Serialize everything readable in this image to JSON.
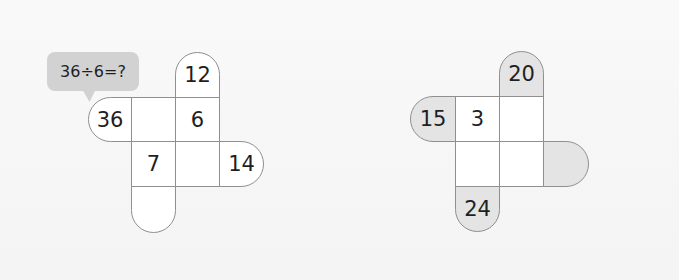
{
  "hint_bubble": {
    "text": "36÷6=?"
  },
  "colors": {
    "border": "#8f8f8f",
    "shaded": "#e4e4e4",
    "bubble": "#d2d2d2"
  },
  "puzzle_left": {
    "top_tab": "12",
    "left_tab": "36",
    "right_tab": "14",
    "bottom_tab": "",
    "grid": [
      [
        "",
        "6"
      ],
      [
        "7",
        ""
      ]
    ]
  },
  "puzzle_right": {
    "top_tab": "20",
    "left_tab": "15",
    "right_tab": "",
    "bottom_tab": "24",
    "grid": [
      [
        "3",
        ""
      ],
      [
        "",
        ""
      ]
    ]
  }
}
